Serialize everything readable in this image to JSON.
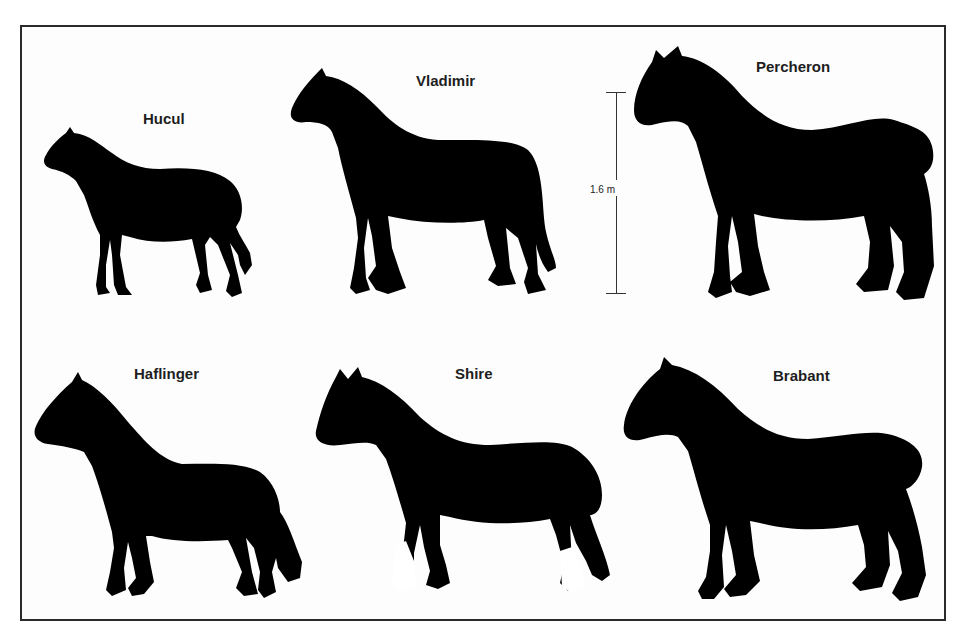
{
  "figure": {
    "scale_bar": {
      "label": "1.6 m"
    },
    "horses": [
      {
        "id": "hucul",
        "name": "Hucul"
      },
      {
        "id": "vladimir",
        "name": "Vladimir"
      },
      {
        "id": "percheron",
        "name": "Percheron"
      },
      {
        "id": "haflinger",
        "name": "Haflinger"
      },
      {
        "id": "shire",
        "name": "Shire"
      },
      {
        "id": "brabant",
        "name": "Brabant"
      }
    ],
    "colors": {
      "silhouette": "#000000",
      "frame": "#2a2a2a",
      "background": "#ffffff"
    }
  }
}
